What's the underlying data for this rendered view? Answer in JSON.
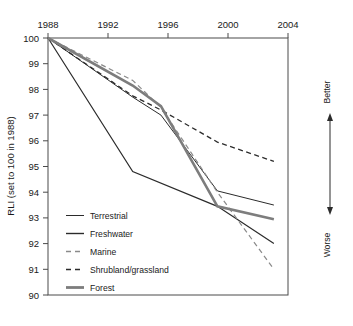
{
  "chart_data": {
    "type": "line",
    "title": "",
    "xlabel": "",
    "ylabel": "RLI (set to 100 in 1988)",
    "x_axis_position": "top",
    "xlim": [
      1988,
      2005
    ],
    "ylim": [
      90,
      100
    ],
    "x_ticks": [
      1988,
      1992,
      1996,
      2000,
      2004
    ],
    "y_ticks": [
      90,
      91,
      92,
      93,
      94,
      95,
      96,
      97,
      98,
      99,
      100
    ],
    "grid": false,
    "legend_position": "inside-lower-left",
    "annotations": [
      "Better",
      "Worse"
    ],
    "series": [
      {
        "name": "Terrestrial",
        "style": "solid-thin-dark",
        "color": "#2b2b2b",
        "width": 1.0,
        "x": [
          1988,
          1994,
          1996,
          2000,
          2004
        ],
        "values": [
          100,
          97.7,
          97.0,
          94.05,
          93.5
        ]
      },
      {
        "name": "Freshwater",
        "style": "solid-thin-dark",
        "color": "#2b2b2b",
        "width": 1.2,
        "x": [
          1988,
          1994,
          2000,
          2004
        ],
        "values": [
          100,
          94.8,
          93.45,
          92.0
        ]
      },
      {
        "name": "Marine",
        "style": "dashed-light",
        "color": "#8a8a8a",
        "width": 1.2,
        "x": [
          1988,
          1994,
          1996,
          2000,
          2004
        ],
        "values": [
          100,
          98.35,
          97.3,
          94.0,
          91.0
        ]
      },
      {
        "name": "Shrubland/grassland",
        "style": "dashed-dark",
        "color": "#2b2b2b",
        "width": 1.3,
        "x": [
          1988,
          1994,
          1996,
          2000,
          2004
        ],
        "values": [
          100,
          97.75,
          97.2,
          95.95,
          95.2
        ]
      },
      {
        "name": "Forest",
        "style": "solid-thick-gray",
        "color": "#7d7d7d",
        "width": 2.6,
        "x": [
          1988,
          1994,
          1996,
          2000,
          2004
        ],
        "values": [
          100,
          98.15,
          97.35,
          93.45,
          92.95
        ]
      }
    ]
  },
  "axes": {
    "y_title": "RLI (set to 100 in 1988)",
    "x_tick_labels": [
      "1988",
      "1992",
      "1996",
      "2000",
      "2004"
    ],
    "y_tick_labels": [
      "100",
      "99",
      "98",
      "97",
      "96",
      "95",
      "94",
      "93",
      "92",
      "91",
      "90"
    ]
  },
  "legend": {
    "items": [
      {
        "label": "Terrestrial",
        "swatch": "solid-thin-dark"
      },
      {
        "label": "Freshwater",
        "swatch": "solid-thin-dark"
      },
      {
        "label": "Marine",
        "swatch": "dashed-light"
      },
      {
        "label": "Shrubland/grassland",
        "swatch": "dashed-dark"
      },
      {
        "label": "Forest",
        "swatch": "solid-thick-gray"
      }
    ]
  },
  "direction_scale": {
    "top_label": "Better",
    "bottom_label": "Worse",
    "icon": "double-headed-vertical-arrow"
  },
  "colors": {
    "dark_line": "#2b2b2b",
    "gray_line": "#7d7d7d",
    "light_dash": "#8a8a8a",
    "frame": "#4a4a4a",
    "background": "#ffffff"
  }
}
